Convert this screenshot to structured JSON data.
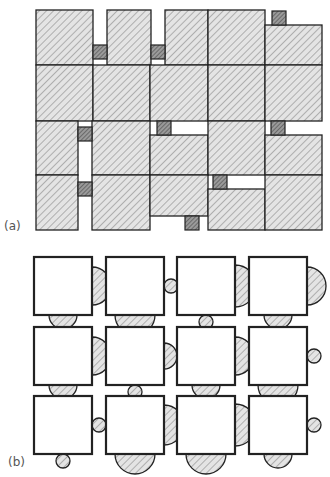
{
  "panels": [
    {
      "id": "a",
      "label": "(a)",
      "description": "Rectangular packing of hatched blocks with small dark connector squares",
      "big_blocks": [
        {
          "x": 36,
          "y": 10,
          "w": 57,
          "h": 55
        },
        {
          "x": 107,
          "y": 10,
          "w": 44,
          "h": 55
        },
        {
          "x": 165,
          "y": 10,
          "w": 43,
          "h": 55
        },
        {
          "x": 208,
          "y": 10,
          "w": 57,
          "h": 55
        },
        {
          "x": 265,
          "y": 25,
          "w": 57,
          "h": 40
        },
        {
          "x": 36,
          "y": 65,
          "w": 57,
          "h": 56
        },
        {
          "x": 93,
          "y": 65,
          "w": 57,
          "h": 56
        },
        {
          "x": 150,
          "y": 65,
          "w": 58,
          "h": 56
        },
        {
          "x": 208,
          "y": 65,
          "w": 57,
          "h": 56
        },
        {
          "x": 265,
          "y": 65,
          "w": 57,
          "h": 56
        },
        {
          "x": 36,
          "y": 121,
          "w": 42,
          "h": 54
        },
        {
          "x": 92,
          "y": 121,
          "w": 58,
          "h": 54
        },
        {
          "x": 150,
          "y": 135,
          "w": 58,
          "h": 40
        },
        {
          "x": 208,
          "y": 121,
          "w": 57,
          "h": 54
        },
        {
          "x": 265,
          "y": 135,
          "w": 57,
          "h": 40
        },
        {
          "x": 36,
          "y": 175,
          "w": 42,
          "h": 55
        },
        {
          "x": 92,
          "y": 175,
          "w": 58,
          "h": 55
        },
        {
          "x": 150,
          "y": 175,
          "w": 58,
          "h": 41
        },
        {
          "x": 208,
          "y": 189,
          "w": 57,
          "h": 41
        },
        {
          "x": 265,
          "y": 175,
          "w": 57,
          "h": 55
        }
      ],
      "small_squares": [
        {
          "x": 93,
          "y": 45,
          "s": 14
        },
        {
          "x": 151,
          "y": 45,
          "s": 14
        },
        {
          "x": 272,
          "y": 11,
          "s": 14
        },
        {
          "x": 78,
          "y": 127,
          "s": 14
        },
        {
          "x": 157,
          "y": 121,
          "s": 14
        },
        {
          "x": 271,
          "y": 121,
          "s": 14
        },
        {
          "x": 78,
          "y": 182,
          "s": 14
        },
        {
          "x": 213,
          "y": 175,
          "s": 14
        },
        {
          "x": 185,
          "y": 216,
          "s": 14
        }
      ]
    },
    {
      "id": "b",
      "label": "(b)",
      "description": "3x4 grid of white squares with hatched semicircle / circle attachments on right and bottom edges",
      "square_size": 58,
      "columns_x": [
        34,
        106,
        177,
        249
      ],
      "rows_y": [
        257,
        327,
        396
      ],
      "cells": [
        {
          "row": 0,
          "col": 0,
          "right": {
            "type": "half",
            "r": 19
          },
          "bottom": {
            "type": "half",
            "r": 14
          }
        },
        {
          "row": 0,
          "col": 1,
          "right": {
            "type": "circle",
            "r": 7
          },
          "bottom": {
            "type": "half",
            "r": 20
          }
        },
        {
          "row": 0,
          "col": 2,
          "right": {
            "type": "half",
            "r": 21
          },
          "bottom": {
            "type": "circle",
            "r": 7
          }
        },
        {
          "row": 0,
          "col": 3,
          "right": {
            "type": "half",
            "r": 19
          },
          "bottom": {
            "type": "half",
            "r": 14
          }
        },
        {
          "row": 1,
          "col": 0,
          "right": {
            "type": "half",
            "r": 19
          },
          "bottom": {
            "type": "half",
            "r": 14
          }
        },
        {
          "row": 1,
          "col": 1,
          "right": {
            "type": "half",
            "r": 13
          },
          "bottom": {
            "type": "circle",
            "r": 7
          }
        },
        {
          "row": 1,
          "col": 2,
          "right": {
            "type": "half",
            "r": 19
          },
          "bottom": {
            "type": "half",
            "r": 14
          }
        },
        {
          "row": 1,
          "col": 3,
          "right": {
            "type": "circle",
            "r": 7
          },
          "bottom": {
            "type": "half",
            "r": 20
          }
        },
        {
          "row": 2,
          "col": 0,
          "right": {
            "type": "circle",
            "r": 7
          },
          "bottom": {
            "type": "circle",
            "r": 7
          }
        },
        {
          "row": 2,
          "col": 1,
          "right": {
            "type": "half",
            "r": 20
          },
          "bottom": {
            "type": "half",
            "r": 20
          }
        },
        {
          "row": 2,
          "col": 2,
          "right": {
            "type": "half",
            "r": 21
          },
          "bottom": {
            "type": "half",
            "r": 20
          }
        },
        {
          "row": 2,
          "col": 3,
          "right": {
            "type": "circle",
            "r": 7
          },
          "bottom": {
            "type": "half",
            "r": 14
          }
        }
      ]
    }
  ],
  "colors": {
    "stroke": "#222222",
    "hatch_bg": "#e4e4e4",
    "hatch_line": "#8a8a8a",
    "small_square_bg": "#9a9a9a",
    "small_square_line": "#4a4a4a",
    "square_fill": "#ffffff",
    "label": "#555555"
  }
}
